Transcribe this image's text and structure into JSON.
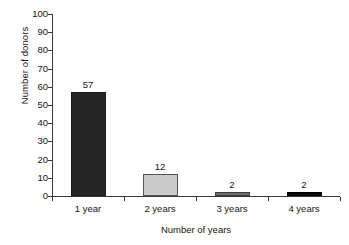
{
  "chart_data": {
    "type": "bar",
    "title": "",
    "xlabel": "Number of years",
    "ylabel": "Number of donors",
    "categories": [
      "1 year",
      "2 years",
      "3 years",
      "4 years"
    ],
    "values": [
      57,
      12,
      2,
      2
    ],
    "value_labels": [
      "57",
      "12",
      "2",
      "2"
    ],
    "ylim": [
      0,
      100
    ],
    "yticks": [
      0,
      10,
      20,
      30,
      40,
      50,
      60,
      70,
      80,
      90,
      100
    ],
    "ytick_labels": [
      "0",
      "10",
      "20",
      "30",
      "40",
      "50",
      "60",
      "70",
      "80",
      "90",
      "100"
    ],
    "grid": false,
    "legend": false,
    "orientation": "vertical",
    "bar_colors": [
      "#262626",
      "#c9c9c9",
      "#6e6e6e",
      "#0d0d0d"
    ],
    "bar_border_colors": [
      "#1a1a1a",
      "#555555",
      "#3d3d3d",
      "#000000"
    ],
    "axis_color": "#3a3a3a",
    "background_color": "#ffffff",
    "text_color": "#151515"
  }
}
